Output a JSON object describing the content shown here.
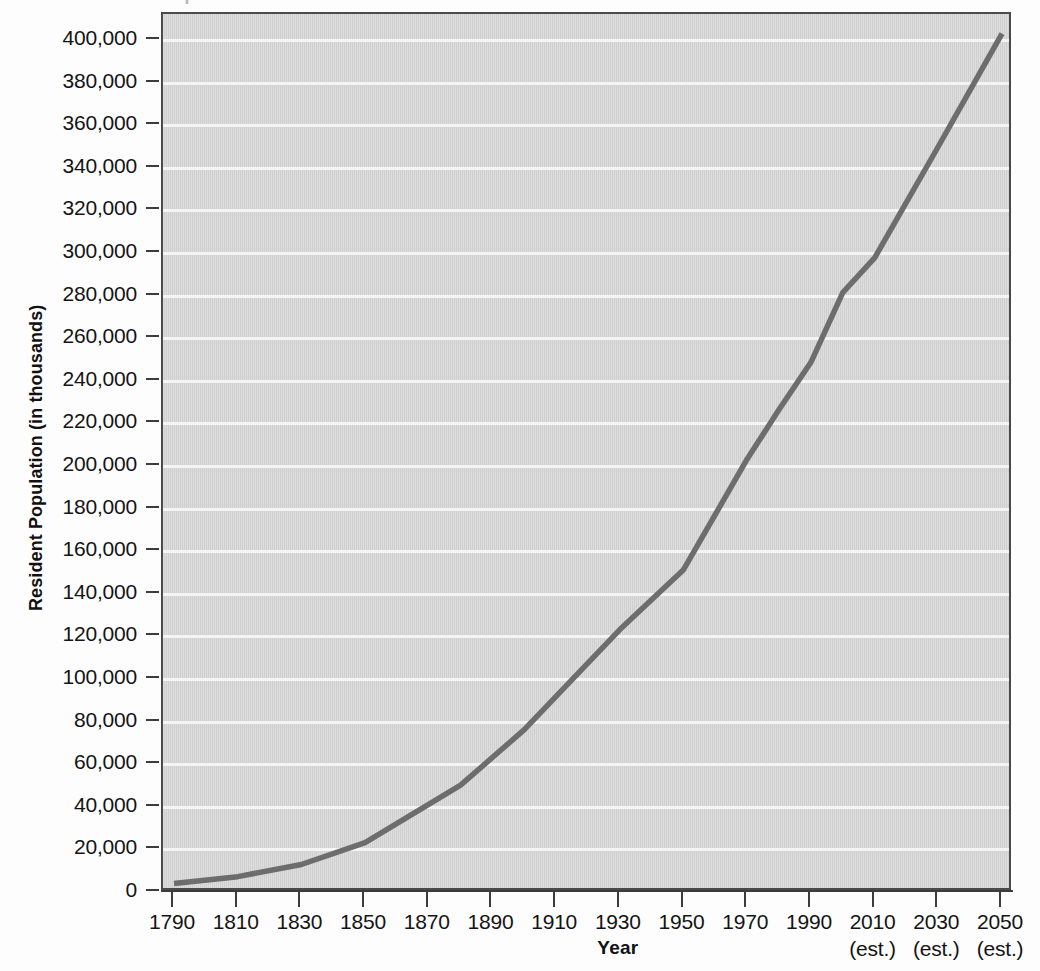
{
  "figure": {
    "cut_off_title": "Population Growth of the United States",
    "y_axis_title": "Resident Population (in thousands)",
    "x_axis_title": "Year",
    "plot_bg_color": "#d7d7d7",
    "gridline_color": "#f4f4f4",
    "line_color": "#6d6d6d",
    "frame_color": "#4a4a4a"
  },
  "chart_data": {
    "type": "line",
    "title": "",
    "xlabel": "Year",
    "ylabel": "Resident Population (in thousands)",
    "xlim": [
      1790,
      2050
    ],
    "ylim": [
      0,
      410000
    ],
    "grid": "horizontal",
    "legend": "none",
    "x_ticks": [
      {
        "value": 1790,
        "label": "1790",
        "sublabel": ""
      },
      {
        "value": 1810,
        "label": "1810",
        "sublabel": ""
      },
      {
        "value": 1830,
        "label": "1830",
        "sublabel": ""
      },
      {
        "value": 1850,
        "label": "1850",
        "sublabel": ""
      },
      {
        "value": 1870,
        "label": "1870",
        "sublabel": ""
      },
      {
        "value": 1890,
        "label": "1890",
        "sublabel": ""
      },
      {
        "value": 1910,
        "label": "1910",
        "sublabel": ""
      },
      {
        "value": 1930,
        "label": "1930",
        "sublabel": ""
      },
      {
        "value": 1950,
        "label": "1950",
        "sublabel": ""
      },
      {
        "value": 1970,
        "label": "1970",
        "sublabel": ""
      },
      {
        "value": 1990,
        "label": "1990",
        "sublabel": ""
      },
      {
        "value": 2010,
        "label": "2010",
        "sublabel": "(est.)"
      },
      {
        "value": 2030,
        "label": "2030",
        "sublabel": "(est.)"
      },
      {
        "value": 2050,
        "label": "2050",
        "sublabel": "(est.)"
      }
    ],
    "y_ticks": [
      {
        "value": 400000,
        "label": "400,000"
      },
      {
        "value": 380000,
        "label": "380,000"
      },
      {
        "value": 360000,
        "label": "360,000"
      },
      {
        "value": 340000,
        "label": "340,000"
      },
      {
        "value": 320000,
        "label": "320,000"
      },
      {
        "value": 300000,
        "label": "300,000"
      },
      {
        "value": 280000,
        "label": "280,000"
      },
      {
        "value": 260000,
        "label": "260,000"
      },
      {
        "value": 240000,
        "label": "240,000"
      },
      {
        "value": 220000,
        "label": "220,000"
      },
      {
        "value": 200000,
        "label": "200,000"
      },
      {
        "value": 180000,
        "label": "180,000"
      },
      {
        "value": 160000,
        "label": "160,000"
      },
      {
        "value": 140000,
        "label": "140,000"
      },
      {
        "value": 120000,
        "label": "120,000"
      },
      {
        "value": 100000,
        "label": "100,000"
      },
      {
        "value": 80000,
        "label": "80,000"
      },
      {
        "value": 60000,
        "label": "60,000"
      },
      {
        "value": 40000,
        "label": "40,000"
      },
      {
        "value": 20000,
        "label": "20,000"
      },
      {
        "value": 0,
        "label": "0"
      }
    ],
    "series": [
      {
        "name": "Resident Population",
        "color": "#6d6d6d",
        "x": [
          1790,
          1810,
          1830,
          1850,
          1880,
          1900,
          1930,
          1950,
          1970,
          1980,
          1990,
          2000,
          2010,
          2030,
          2050
        ],
        "values": [
          4000,
          7200,
          12900,
          23200,
          50200,
          76200,
          123200,
          151300,
          203300,
          226500,
          248700,
          281400,
          297700,
          350000,
          403000
        ]
      }
    ]
  }
}
